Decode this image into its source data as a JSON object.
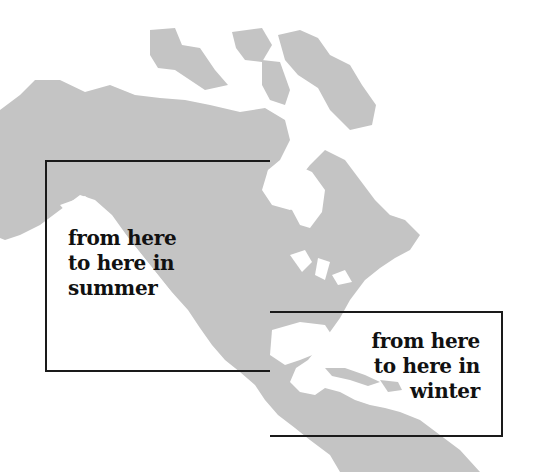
{
  "map": {
    "region": "North America and Central America",
    "land_color": "#c4c4c4",
    "water_color": "#ffffff",
    "line_color": "#1a1a1a"
  },
  "annotations": [
    {
      "id": "summer",
      "lines": [
        "from here",
        "to here in",
        "summer"
      ]
    },
    {
      "id": "winter",
      "lines": [
        "from here",
        "to here in",
        "winter"
      ]
    }
  ]
}
